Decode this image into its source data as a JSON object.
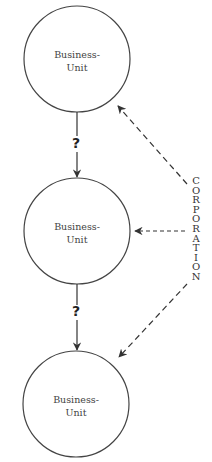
{
  "diagram": {
    "units": [
      {
        "line1": "Business-",
        "line2": "Unit"
      },
      {
        "line1": "Business-",
        "line2": "Unit"
      },
      {
        "line1": "Business-",
        "line2": "Unit"
      }
    ],
    "question_marks": [
      "?",
      "?"
    ],
    "corporation_letters": [
      "C",
      "O",
      "R",
      "P",
      "O",
      "R",
      "A",
      "T",
      "I",
      "O",
      "N"
    ],
    "colors": {
      "stroke": "#333333",
      "text": "#444444"
    }
  }
}
